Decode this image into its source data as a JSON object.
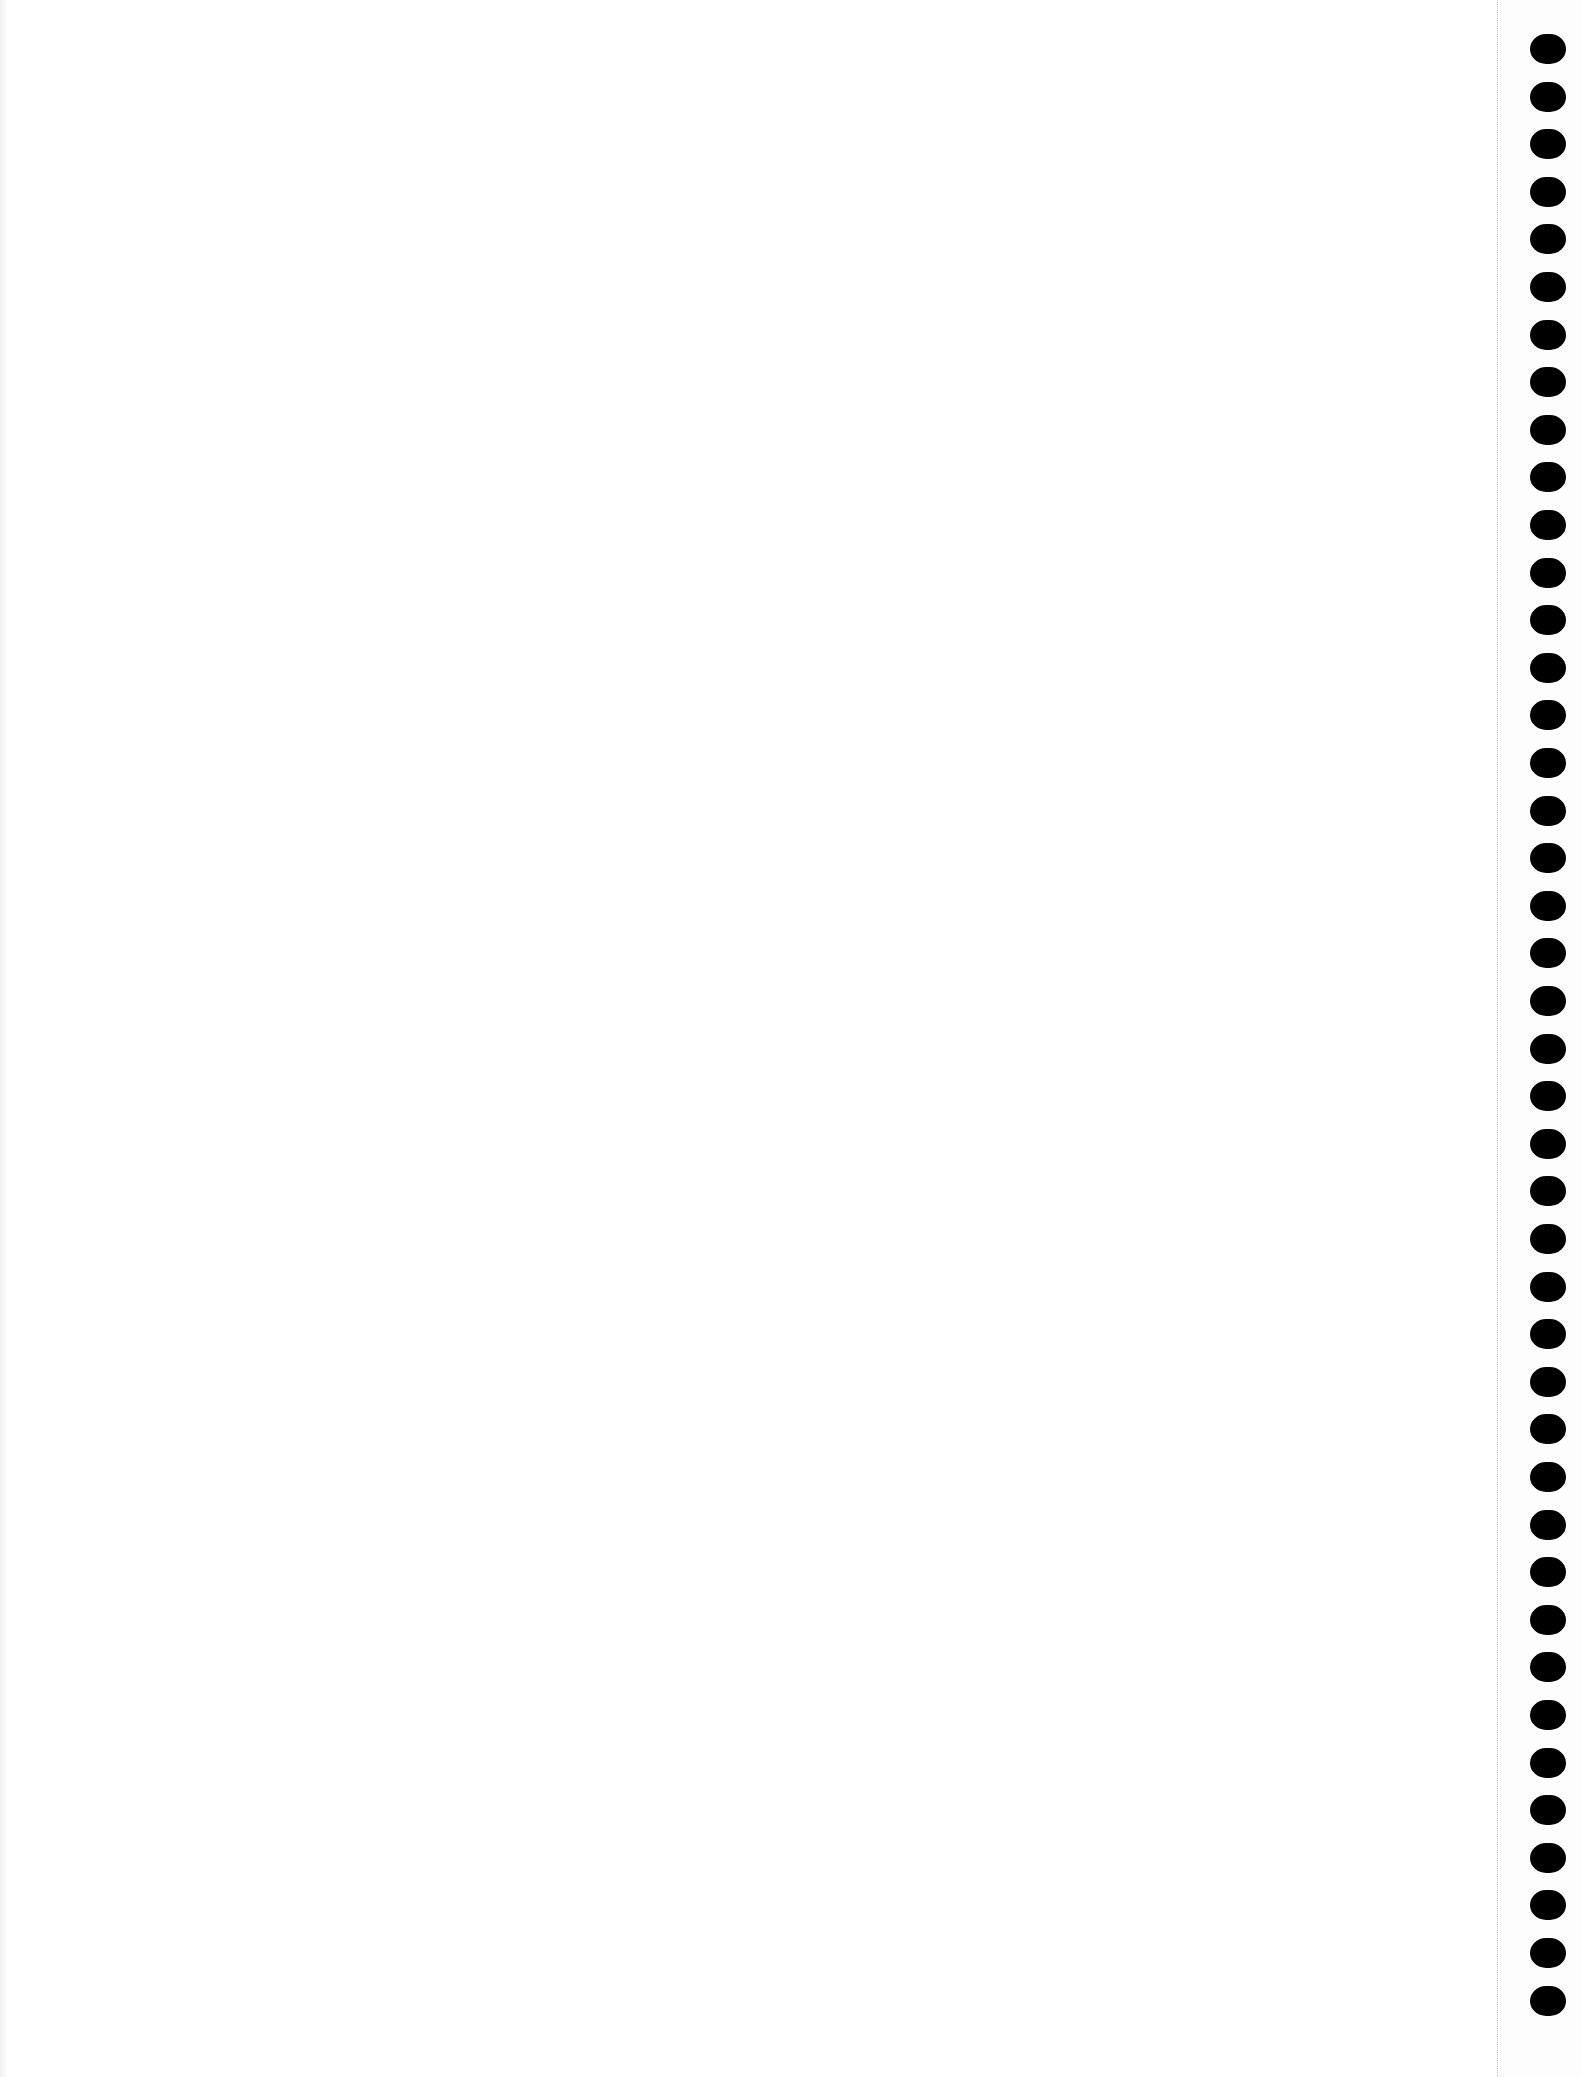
{
  "page": {
    "type": "blank-notebook-sheet",
    "background_color": "#ffffff",
    "binding": {
      "side": "right",
      "hole_count": 42,
      "hole_color": "#000000",
      "first_hole_top": 34,
      "hole_spacing": 47.6,
      "perforation_line_x": 1497
    }
  }
}
